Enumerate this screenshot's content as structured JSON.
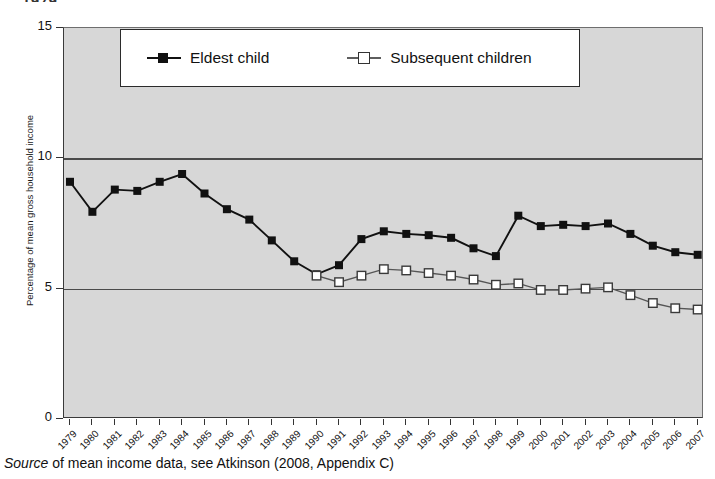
{
  "figure": {
    "top_cropped_fragment": "1979",
    "source_note_prefix": "Source",
    "source_note_rest": " of mean income data, see Atkinson (2008, Appendix C)"
  },
  "chart_data": {
    "type": "line",
    "title": "",
    "xlabel": "",
    "ylabel": "Percentage of mean gross household income",
    "ylim": [
      0,
      15
    ],
    "yticks": [
      0,
      5,
      10,
      15
    ],
    "grid": true,
    "gridlines_at": [
      5,
      10
    ],
    "legend_position": "top-center",
    "background": "#d7d7d7",
    "categories": [
      "1979",
      "1980",
      "1981",
      "1982",
      "1983",
      "1984",
      "1985",
      "1986",
      "1987",
      "1988",
      "1989",
      "1990",
      "1991",
      "1992",
      "1993",
      "1994",
      "1995",
      "1996",
      "1997",
      "1998",
      "1999",
      "2000",
      "2001",
      "2002",
      "2003",
      "2004",
      "2005",
      "2006",
      "2007"
    ],
    "series": [
      {
        "name": "Eldest child",
        "marker": "filled-square",
        "color": "#111111",
        "values": [
          9.1,
          7.95,
          8.8,
          8.75,
          9.1,
          9.4,
          8.65,
          8.05,
          7.65,
          6.85,
          6.05,
          5.55,
          5.9,
          6.9,
          7.2,
          7.1,
          7.05,
          6.95,
          6.55,
          6.25,
          7.8,
          7.4,
          7.45,
          7.4,
          7.5,
          7.1,
          6.65,
          6.4,
          6.3
        ]
      },
      {
        "name": "Subsequent children",
        "marker": "open-square",
        "color": "#555555",
        "values": [
          null,
          null,
          null,
          null,
          null,
          null,
          null,
          null,
          null,
          null,
          null,
          5.5,
          5.25,
          5.5,
          5.75,
          5.7,
          5.6,
          5.5,
          5.35,
          5.15,
          5.2,
          4.95,
          4.95,
          5.0,
          5.05,
          4.75,
          4.45,
          4.25,
          4.2
        ]
      }
    ]
  },
  "axes": {
    "y_tick_labels": [
      "15",
      "10",
      "5",
      "0"
    ]
  }
}
